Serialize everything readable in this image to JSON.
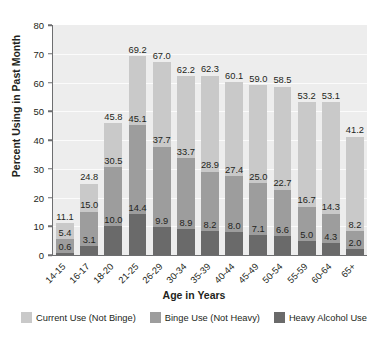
{
  "chart_data": {
    "type": "bar",
    "subtype": "stacked-bar",
    "title": "",
    "xlabel": "Age in Years",
    "ylabel": "Percent Using in Past Month",
    "ylim": [
      0,
      80
    ],
    "yticks": [
      0,
      10,
      20,
      30,
      40,
      50,
      60,
      70,
      80
    ],
    "grid": true,
    "legend_position": "bottom",
    "categories": [
      "14-15",
      "16-17",
      "18-20",
      "21-25",
      "26-29",
      "30-34",
      "35-39",
      "40-44",
      "45-49",
      "50-54",
      "55-59",
      "60-64",
      "65+"
    ],
    "series": [
      {
        "name": "Current Use (Not Binge)",
        "color": "#c9c9c9",
        "values": [
          5.7,
          9.8,
          15.3,
          24.1,
          29.3,
          28.5,
          33.4,
          32.7,
          34.0,
          35.8,
          36.5,
          38.8,
          33.0
        ]
      },
      {
        "name": "Binge Use (Not Heavy)",
        "color": "#9d9d9d",
        "values": [
          4.8,
          11.9,
          20.5,
          30.7,
          27.8,
          24.8,
          20.7,
          19.4,
          17.9,
          16.1,
          11.7,
          10.0,
          6.2
        ]
      },
      {
        "name": "Heavy Alcohol Use",
        "color": "#6a6a6a",
        "values": [
          0.6,
          3.1,
          10.0,
          14.4,
          9.9,
          8.9,
          8.2,
          8.0,
          7.1,
          6.6,
          5.0,
          4.3,
          2.0
        ]
      }
    ],
    "totals": [
      11.1,
      24.8,
      45.8,
      69.2,
      67.0,
      62.2,
      62.3,
      60.1,
      59.0,
      58.5,
      53.2,
      53.1,
      41.2
    ],
    "binge_cumulative": [
      5.4,
      15.0,
      30.5,
      45.1,
      37.7,
      33.7,
      28.9,
      27.4,
      25.0,
      22.7,
      16.7,
      14.3,
      8.2
    ],
    "heavy_values": [
      0.6,
      3.1,
      10.0,
      14.4,
      9.9,
      8.9,
      8.2,
      8.0,
      7.1,
      6.6,
      5.0,
      4.3,
      2.0
    ],
    "labels": {
      "totals": [
        "11.1",
        "24.8",
        "45.8",
        "69.2",
        "67.0",
        "62.2",
        "62.3",
        "60.1",
        "59.0",
        "58.5",
        "53.2",
        "53.1",
        "41.2"
      ],
      "binge": [
        "5.4",
        "15.0",
        "30.5",
        "45.1",
        "37.7",
        "33.7",
        "28.9",
        "27.4",
        "25.0",
        "22.7",
        "16.7",
        "14.3",
        "8.2"
      ],
      "heavy": [
        "0.6",
        "3.1",
        "10.0",
        "14.4",
        "9.9",
        "8.9",
        "8.2",
        "8.0",
        "7.1",
        "6.6",
        "5.0",
        "4.3",
        "2.0"
      ]
    },
    "ytick_labels": [
      "0",
      "10",
      "20",
      "30",
      "40",
      "50",
      "60",
      "70",
      "80"
    ]
  },
  "legend": {
    "items": [
      {
        "label": "Current Use (Not Binge)",
        "color": "#c9c9c9"
      },
      {
        "label": "Binge Use (Not Heavy)",
        "color": "#9d9d9d"
      },
      {
        "label": "Heavy Alcohol Use",
        "color": "#6a6a6a"
      }
    ]
  },
  "colors": {
    "plot_background": "#ededed",
    "axis": "#6d6e70",
    "gridline": "#fbfbfb",
    "text": "#231f20",
    "page_background": "#ffffff"
  }
}
